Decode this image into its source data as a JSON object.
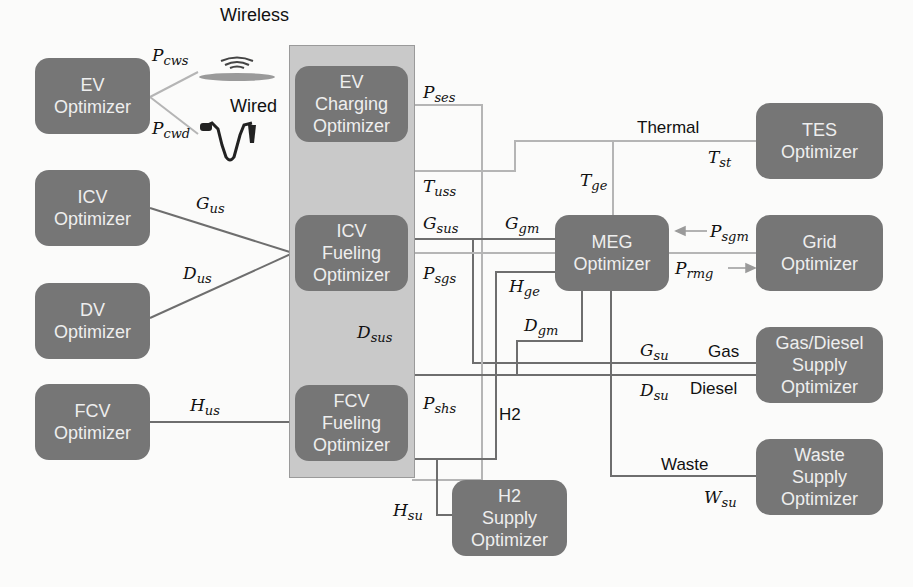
{
  "colors": {
    "node_fill": "#767676",
    "container_fill": "#c9c9c9",
    "line_dark": "#6e6e6e",
    "line_light": "#b5b5b5",
    "background": "#fbfbfa"
  },
  "nodes": {
    "ev": {
      "line1": "EV",
      "line2": "Optimizer"
    },
    "icv": {
      "line1": "ICV",
      "line2": "Optimizer"
    },
    "dv": {
      "line1": "DV",
      "line2": "Optimizer"
    },
    "fcv": {
      "line1": "FCV",
      "line2": "Optimizer"
    },
    "ev_charging": {
      "line1": "EV",
      "line2": "Charging",
      "line3": "Optimizer"
    },
    "icv_fueling": {
      "line1": "ICV",
      "line2": "Fueling",
      "line3": "Optimizer"
    },
    "fcv_fueling": {
      "line1": "FCV",
      "line2": "Fueling",
      "line3": "Optimizer"
    },
    "meg": {
      "line1": "MEG",
      "line2": "Optimizer"
    },
    "tes": {
      "line1": "TES",
      "line2": "Optimizer"
    },
    "grid": {
      "line1": "Grid",
      "line2": "Optimizer"
    },
    "gas_diesel": {
      "line1": "Gas/Diesel",
      "line2": "Supply",
      "line3": "Optimizer"
    },
    "waste": {
      "line1": "Waste",
      "line2": "Supply",
      "line3": "Optimizer"
    },
    "h2_supply": {
      "line1": "H2",
      "line2": "Supply",
      "line3": "Optimizer"
    }
  },
  "labels": {
    "wireless": "Wireless",
    "wired": "Wired",
    "thermal": "Thermal",
    "gas": "Gas",
    "diesel": "Diesel",
    "h2": "H2",
    "waste": "Waste"
  },
  "variables": {
    "P_cws": {
      "base": "P",
      "sub": "cws"
    },
    "P_cwd": {
      "base": "P",
      "sub": "cwd"
    },
    "G_us": {
      "base": "G",
      "sub": "us"
    },
    "D_us": {
      "base": "D",
      "sub": "us"
    },
    "H_us": {
      "base": "H",
      "sub": "us"
    },
    "P_ses": {
      "base": "P",
      "sub": "ses"
    },
    "T_uss": {
      "base": "T",
      "sub": "uss"
    },
    "G_sus": {
      "base": "G",
      "sub": "sus"
    },
    "P_sgs": {
      "base": "P",
      "sub": "sgs"
    },
    "D_sus": {
      "base": "D",
      "sub": "sus"
    },
    "P_shs": {
      "base": "P",
      "sub": "shs"
    },
    "H_su": {
      "base": "H",
      "sub": "su"
    },
    "G_gm": {
      "base": "G",
      "sub": "gm"
    },
    "T_ge": {
      "base": "T",
      "sub": "ge"
    },
    "H_ge": {
      "base": "H",
      "sub": "ge"
    },
    "D_gm": {
      "base": "D",
      "sub": "gm"
    },
    "T_st": {
      "base": "T",
      "sub": "st"
    },
    "P_sgm": {
      "base": "P",
      "sub": "sgm"
    },
    "P_rmg": {
      "base": "P",
      "sub": "rmg"
    },
    "G_su": {
      "base": "G",
      "sub": "su"
    },
    "D_su": {
      "base": "D",
      "sub": "su"
    },
    "W_su": {
      "base": "W",
      "sub": "su"
    }
  },
  "icons": {
    "wireless_charger": "wireless-charging-pad-icon",
    "wired_charger": "charging-plug-cable-icon"
  }
}
